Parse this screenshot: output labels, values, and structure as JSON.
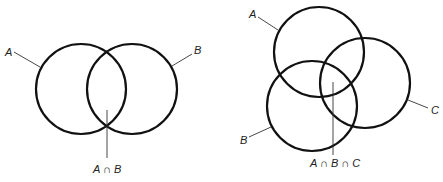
{
  "diagrams": [
    {
      "name": "two-set-venn",
      "sets": [
        {
          "label": "A",
          "cx": 81,
          "cy": 89,
          "r": 45
        },
        {
          "label": "B",
          "cx": 132,
          "cy": 89,
          "r": 45
        }
      ],
      "intersection_label": "A ∩ B"
    },
    {
      "name": "three-set-venn",
      "sets": [
        {
          "label": "A",
          "cx": 319,
          "cy": 52,
          "r": 45
        },
        {
          "label": "B",
          "cx": 312,
          "cy": 106,
          "r": 45
        },
        {
          "label": "C",
          "cx": 365,
          "cy": 83,
          "r": 45
        }
      ],
      "intersection_label": "A ∩ B ∩ C"
    }
  ],
  "labels": {
    "left_a": "A",
    "left_b": "B",
    "left_intersection": "A ∩ B",
    "right_a": "A",
    "right_b": "B",
    "right_c": "C",
    "right_intersection": "A ∩ B ∩ C"
  }
}
